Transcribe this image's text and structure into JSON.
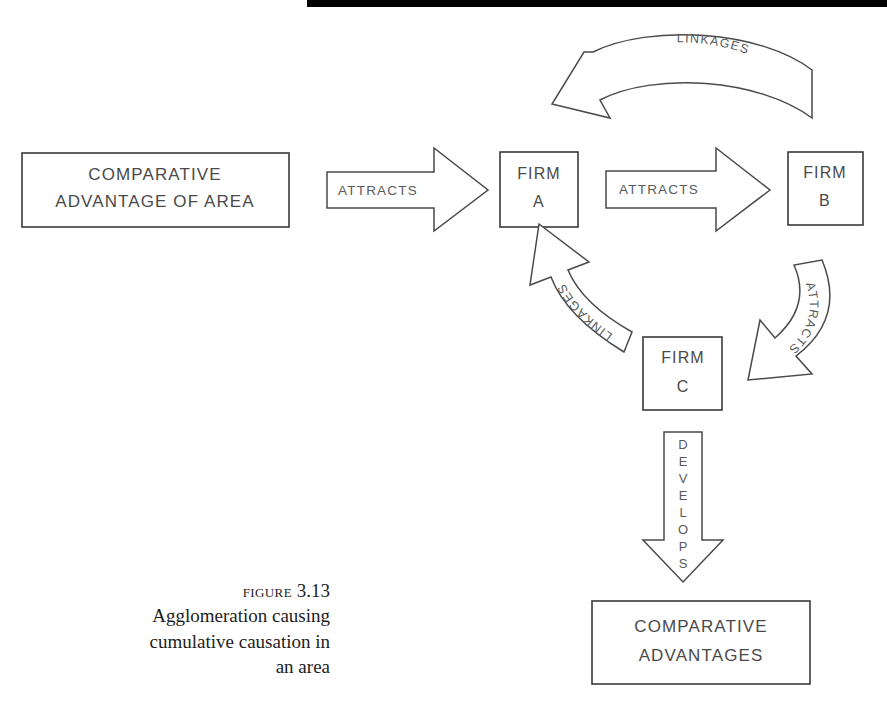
{
  "figure": {
    "caption_label": "Figure",
    "caption_number": "3.13",
    "caption_lines": [
      "Agglomeration causing",
      "cumulative causation in",
      "an area"
    ]
  },
  "nodes": [
    {
      "id": "comparative-advantage-of-area",
      "line1": "COMPARATIVE",
      "line2": "ADVANTAGE OF AREA"
    },
    {
      "id": "firm-a",
      "line1": "FIRM",
      "line2": "A"
    },
    {
      "id": "firm-b",
      "line1": "FIRM",
      "line2": "B"
    },
    {
      "id": "firm-c",
      "line1": "FIRM",
      "line2": "C"
    },
    {
      "id": "comparative-advantages",
      "line1": "COMPARATIVE",
      "line2": "ADVANTAGES"
    }
  ],
  "arrows": [
    {
      "id": "attracts-area-to-firm-a",
      "label": "ATTRACTS",
      "from": "comparative-advantage-of-area",
      "to": "firm-a",
      "direction": "right"
    },
    {
      "id": "attracts-firm-a-to-firm-b",
      "label": "ATTRACTS",
      "from": "firm-a",
      "to": "firm-b",
      "direction": "right"
    },
    {
      "id": "linkages-firm-b-to-firm-a",
      "label": "LINKAGES",
      "from": "firm-b",
      "to": "firm-a",
      "direction": "curved-left"
    },
    {
      "id": "attracts-firm-b-to-firm-c",
      "label": "ATTRACTS",
      "from": "firm-b",
      "to": "firm-c",
      "direction": "curved-down-left"
    },
    {
      "id": "linkages-firm-c-to-firm-a",
      "label": "LINKAGES",
      "from": "firm-c",
      "to": "firm-a",
      "direction": "curved-up-left"
    },
    {
      "id": "develops-firm-c-to-advantages",
      "label": "DEVELOPS",
      "label_letters": [
        "D",
        "E",
        "V",
        "E",
        "L",
        "O",
        "P",
        "S"
      ],
      "from": "firm-c",
      "to": "comparative-advantages",
      "direction": "down"
    }
  ],
  "colors": {
    "background": "#ffffff",
    "stroke": "#3a3a3a",
    "arrow_stroke": "#4a4a4a",
    "text": "#4a4a4a",
    "caption_text": "#1d1d1d",
    "scan_bar": "#000000"
  }
}
